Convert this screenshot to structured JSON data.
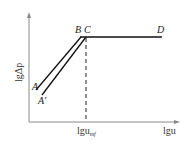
{
  "diagram": {
    "y_axis_label": "lgΔp",
    "x_axis_label": "lgu",
    "critical_label_main": "lgu",
    "critical_label_sub": "mf",
    "points": {
      "A": "A",
      "A_prime": "A'",
      "B": "B",
      "C": "C",
      "D": "D"
    },
    "colors": {
      "line": "#111111",
      "axis": "#777777",
      "dashed": "#222222"
    }
  }
}
